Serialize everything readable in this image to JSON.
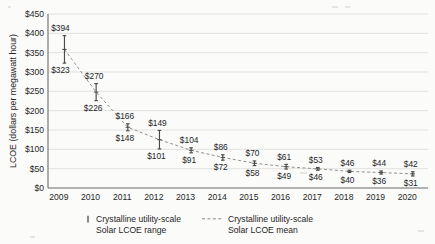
{
  "chart_data": {
    "type": "line",
    "title": "",
    "subtitle": "",
    "xlabel": "",
    "ylabel": "LCOE (dollars per megawatt hour)",
    "ylim": [
      0,
      450
    ],
    "ytick_step": 50,
    "grid": true,
    "legend_position": "bottom",
    "categories": [
      "2009",
      "2010",
      "2011",
      "2012",
      "2013",
      "2014",
      "2015",
      "2016",
      "2017",
      "2018",
      "2019",
      "2020"
    ],
    "x": [
      2009,
      2010,
      2011,
      2012,
      2013,
      2014,
      2015,
      2016,
      2017,
      2018,
      2019,
      2020
    ],
    "ytick_labels": [
      "$0",
      "$50",
      "$100",
      "$150",
      "$200",
      "$250",
      "$300",
      "$350",
      "$400",
      "$450"
    ],
    "ytick_values": [
      0,
      50,
      100,
      150,
      200,
      250,
      300,
      350,
      400,
      450
    ],
    "xtick_labels": [
      "2009",
      "2010",
      "2011",
      "2012",
      "2013",
      "2014",
      "2015",
      "2016",
      "2017",
      "2018",
      "2019",
      "2020"
    ],
    "series": [
      {
        "name": "Crystalline utility-scale Solar LCOE range",
        "type": "range",
        "high": [
          394,
          270,
          166,
          149,
          104,
          86,
          70,
          61,
          53,
          46,
          44,
          42
        ],
        "low": [
          323,
          226,
          148,
          101,
          91,
          72,
          58,
          49,
          46,
          40,
          36,
          31
        ],
        "high_labels": [
          "$394",
          "$270",
          "$166",
          "$149",
          "$104",
          "$86",
          "$70",
          "$61",
          "$53",
          "$46",
          "$44",
          "$42"
        ],
        "low_labels": [
          "$323",
          "$226",
          "$148",
          "$101",
          "$91",
          "$72",
          "$58",
          "$49",
          "$46",
          "$40",
          "$36",
          "$31"
        ]
      },
      {
        "name": "Crystalline utility-scale Solar LCOE mean",
        "type": "line",
        "style": "dashed",
        "values": [
          358.5,
          248,
          157,
          125,
          97.5,
          79,
          64,
          55,
          49.5,
          43,
          40,
          36.5
        ]
      }
    ]
  },
  "legend": {
    "items": [
      {
        "label_line1": "Crystalline utility-scale",
        "label_line2": "Solar LCOE range",
        "marker": "vertical-bar-marker"
      },
      {
        "label_line1": "Crystalline utility-scale",
        "label_line2": "Solar LCOE mean",
        "marker": "dashed-line-marker"
      }
    ]
  },
  "colors": {
    "range_bar": "#4a4a4a",
    "mean_line": "#8a8a8a",
    "grid": "#d9d9d7",
    "axis": "#6b6b6b",
    "text": "#1f1f1f",
    "background": "#fbfbfa"
  }
}
